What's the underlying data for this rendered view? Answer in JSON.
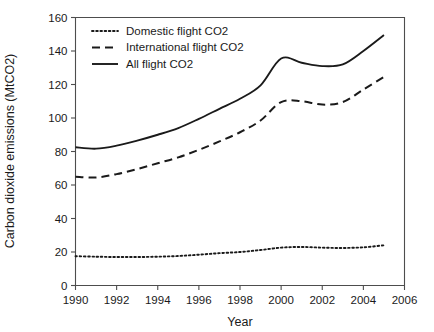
{
  "chart_data": {
    "type": "line",
    "title": "",
    "xlabel": "Year",
    "ylabel": "Carbon dioxide emissions (MtCO2)",
    "xlim": [
      1990,
      2006
    ],
    "ylim": [
      0,
      160
    ],
    "xticks": [
      1990,
      1992,
      1994,
      1996,
      1998,
      2000,
      2002,
      2004,
      2006
    ],
    "yticks": [
      0,
      20,
      40,
      60,
      80,
      100,
      120,
      140,
      160
    ],
    "grid": false,
    "legend_position": "top-left-inside",
    "x": [
      1990,
      1991,
      1992,
      1993,
      1994,
      1995,
      1996,
      1997,
      1998,
      1999,
      2000,
      2001,
      2002,
      2003,
      2004,
      2005
    ],
    "series": [
      {
        "name": "Domestic flight CO2",
        "style": "dotted",
        "color": "#1a1a1a",
        "values": [
          17.5,
          17.2,
          17.0,
          17.0,
          17.2,
          17.6,
          18.4,
          19.3,
          20.0,
          21.2,
          22.6,
          23.0,
          22.6,
          22.4,
          22.8,
          24.0
        ]
      },
      {
        "name": "International flight CO2",
        "style": "dashed",
        "color": "#1a1a1a",
        "values": [
          65.0,
          64.5,
          66.5,
          69.5,
          73.0,
          76.5,
          81.0,
          86.0,
          91.5,
          98.5,
          109.5,
          110.0,
          108.0,
          109.5,
          117.0,
          124.5
        ]
      },
      {
        "name": "All flight CO2",
        "style": "solid",
        "color": "#1a1a1a",
        "values": [
          82.5,
          81.7,
          83.5,
          86.5,
          90.0,
          94.0,
          99.5,
          105.5,
          111.5,
          119.5,
          135.5,
          133.0,
          131.0,
          132.0,
          140.0,
          149.5
        ]
      }
    ]
  },
  "legend": {
    "entries": [
      {
        "label": "Domestic flight CO2",
        "style": "dotted"
      },
      {
        "label": "International flight CO2",
        "style": "dashed"
      },
      {
        "label": "All flight CO2",
        "style": "solid"
      }
    ]
  },
  "axes": {
    "y_title": "Carbon dioxide emissions (MtCO2)",
    "x_title": "Year",
    "y_tick_labels": [
      "0",
      "20",
      "40",
      "60",
      "80",
      "100",
      "120",
      "140",
      "160"
    ],
    "x_tick_labels": [
      "1990",
      "1992",
      "1994",
      "1996",
      "1998",
      "2000",
      "2002",
      "2004",
      "2006"
    ]
  },
  "colors": {
    "ink": "#1a1a1a",
    "axis": "#4d4d4d",
    "background": "#ffffff"
  }
}
